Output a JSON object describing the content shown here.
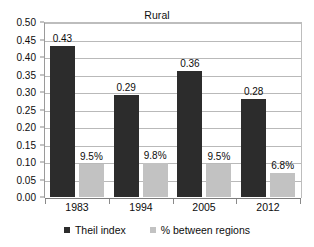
{
  "chart_data": {
    "type": "bar",
    "title": "Rural",
    "xlabel": "",
    "ylabel": "",
    "categories": [
      "1983",
      "1994",
      "2005",
      "2012"
    ],
    "ylim": [
      0.0,
      0.5
    ],
    "ytick_step": 0.05,
    "ytick_labels": [
      "0.00",
      "0.05",
      "0.10",
      "0.15",
      "0.20",
      "0.25",
      "0.30",
      "0.35",
      "0.40",
      "0.45",
      "0.50"
    ],
    "ytick_values": [
      0.0,
      0.05,
      0.1,
      0.15,
      0.2,
      0.25,
      0.3,
      0.35,
      0.4,
      0.45,
      0.5
    ],
    "grid": true,
    "legend_position": "bottom",
    "series": [
      {
        "name": "Theil index",
        "color": "#2c2c2c",
        "values": [
          0.43,
          0.29,
          0.36,
          0.28
        ],
        "labels": [
          "0.43",
          "0.29",
          "0.36",
          "0.28"
        ]
      },
      {
        "name": "% between regions",
        "color": "#c2c2c2",
        "values": [
          0.095,
          0.098,
          0.095,
          0.068
        ],
        "labels": [
          "9.5%",
          "9.8%",
          "9.5%",
          "6.8%"
        ]
      }
    ]
  },
  "legend": {
    "items": [
      {
        "label": "Theil index"
      },
      {
        "label": "% between regions"
      }
    ]
  }
}
